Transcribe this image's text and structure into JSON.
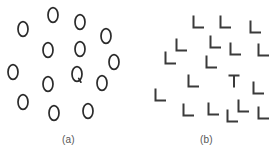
{
  "figure": {
    "background_color": "#ffffff",
    "item_color": "#2b2b2b",
    "caption_color": "#555555"
  },
  "panels": [
    {
      "id": "panel-a",
      "caption": "(a)",
      "search_type": "feature search",
      "target_label": "Q",
      "distractor_label": "O",
      "item_count": 15,
      "items": [
        {
          "label": "O",
          "is_target": false,
          "x": 23,
          "y": 29,
          "rotation": 0
        },
        {
          "label": "O",
          "is_target": false,
          "x": 53,
          "y": 15,
          "rotation": 0
        },
        {
          "label": "O",
          "is_target": false,
          "x": 80,
          "y": 22,
          "rotation": 0
        },
        {
          "label": "O",
          "is_target": false,
          "x": 106,
          "y": 36,
          "rotation": 0
        },
        {
          "label": "O",
          "is_target": false,
          "x": 48,
          "y": 50,
          "rotation": 0
        },
        {
          "label": "O",
          "is_target": false,
          "x": 80,
          "y": 49,
          "rotation": 0
        },
        {
          "label": "O",
          "is_target": false,
          "x": 114,
          "y": 62,
          "rotation": 0
        },
        {
          "label": "O",
          "is_target": false,
          "x": 13,
          "y": 72,
          "rotation": 0
        },
        {
          "label": "O",
          "is_target": false,
          "x": 48,
          "y": 84,
          "rotation": 0
        },
        {
          "label": "Q",
          "is_target": true,
          "x": 77,
          "y": 74,
          "rotation": 0
        },
        {
          "label": "O",
          "is_target": false,
          "x": 102,
          "y": 83,
          "rotation": 0
        },
        {
          "label": "O",
          "is_target": false,
          "x": 23,
          "y": 102,
          "rotation": 0
        },
        {
          "label": "O",
          "is_target": false,
          "x": 54,
          "y": 113,
          "rotation": 0
        },
        {
          "label": "O",
          "is_target": false,
          "x": 88,
          "y": 111,
          "rotation": 0
        }
      ]
    },
    {
      "id": "panel-b",
      "caption": "(b)",
      "search_type": "conjunction search",
      "target_label": "T",
      "distractor_label": "L",
      "item_count": 18,
      "items": [
        {
          "label": "L",
          "is_target": false,
          "x": 60,
          "y": 22,
          "rotation": 0
        },
        {
          "label": "L",
          "is_target": false,
          "x": 87,
          "y": 22,
          "rotation": 0
        },
        {
          "label": "L",
          "is_target": false,
          "x": 117,
          "y": 27,
          "rotation": 0
        },
        {
          "label": "L",
          "is_target": false,
          "x": 43,
          "y": 45,
          "rotation": 0
        },
        {
          "label": "L",
          "is_target": false,
          "x": 77,
          "y": 42,
          "rotation": 0
        },
        {
          "label": "L",
          "is_target": false,
          "x": 97,
          "y": 49,
          "rotation": 0
        },
        {
          "label": "L",
          "is_target": false,
          "x": 125,
          "y": 50,
          "rotation": 0
        },
        {
          "label": "L",
          "is_target": false,
          "x": 32,
          "y": 58,
          "rotation": 0
        },
        {
          "label": "L",
          "is_target": false,
          "x": 73,
          "y": 62,
          "rotation": 0
        },
        {
          "label": "L",
          "is_target": false,
          "x": 55,
          "y": 81,
          "rotation": 0
        },
        {
          "label": "T",
          "is_target": true,
          "x": 96,
          "y": 81,
          "rotation": 0
        },
        {
          "label": "L",
          "is_target": false,
          "x": 120,
          "y": 88,
          "rotation": 0
        },
        {
          "label": "L",
          "is_target": false,
          "x": 22,
          "y": 95,
          "rotation": 0
        },
        {
          "label": "L",
          "is_target": false,
          "x": 50,
          "y": 110,
          "rotation": 0
        },
        {
          "label": "L",
          "is_target": false,
          "x": 75,
          "y": 109,
          "rotation": 0
        },
        {
          "label": "L",
          "is_target": false,
          "x": 105,
          "y": 106,
          "rotation": 0
        },
        {
          "label": "L",
          "is_target": false,
          "x": 94,
          "y": 116,
          "rotation": 0
        },
        {
          "label": "L",
          "is_target": false,
          "x": 125,
          "y": 113,
          "rotation": 0
        }
      ]
    }
  ]
}
